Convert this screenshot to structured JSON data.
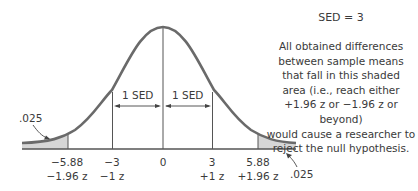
{
  "title": "SED = 3",
  "annotation": {
    "lines": [
      "All obtained differences",
      "between sample means",
      "that fall in this shaded",
      "area (i.e., reach either",
      "+1.96 z or −1.96 z or beyond)",
      "would cause a researcher to",
      "reject the null hypothesis."
    ]
  },
  "intervals": {
    "left": "1 SED",
    "right": "1 SED"
  },
  "tail_labels": {
    "left": ".025",
    "right": ".025"
  },
  "ticks": [
    {
      "value": "−5.88",
      "z": "−1.96 z"
    },
    {
      "value": "−3",
      "z": "−1 z"
    },
    {
      "value": "0",
      "z": ""
    },
    {
      "value": "3",
      "z": "+1 z"
    },
    {
      "value": "5.88",
      "z": "+1.96 z"
    }
  ],
  "colors": {
    "curve": "#666666",
    "shade": "#d4d4d4",
    "lines": "#555555",
    "text": "#3a3a3a"
  }
}
